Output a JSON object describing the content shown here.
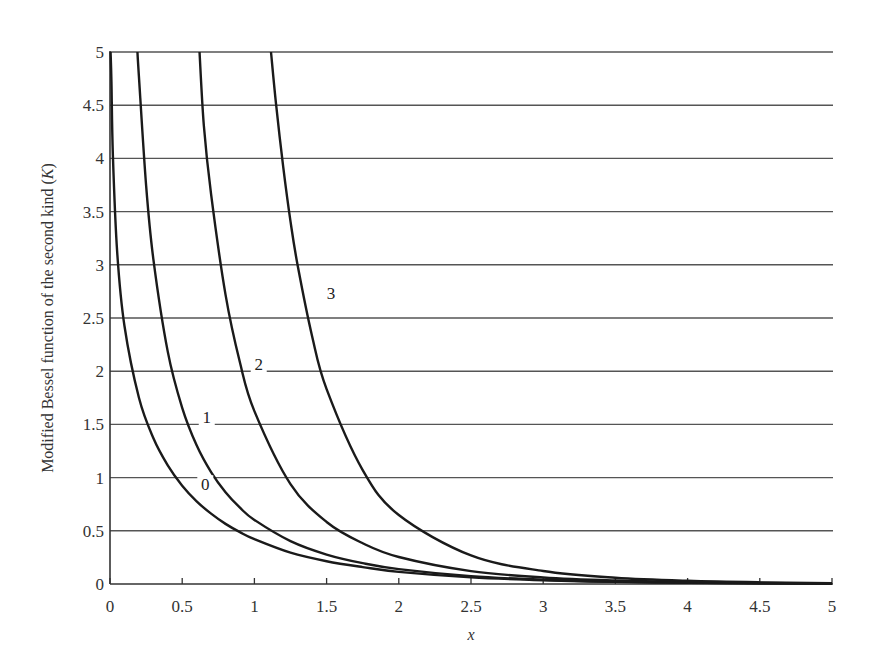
{
  "chart_data": {
    "type": "line",
    "title": "",
    "xlabel": "x",
    "ylabel": "Modified Bessel function of the second kind (K)",
    "xlim": [
      0,
      5
    ],
    "ylim": [
      0,
      5
    ],
    "x_ticks": [
      "0",
      "0.5",
      "1",
      "1.5",
      "2",
      "2.5",
      "3",
      "3.5",
      "4",
      "4.5",
      "5"
    ],
    "y_ticks": [
      "0",
      "0.5",
      "1",
      "1.5",
      "2",
      "2.5",
      "3",
      "3.5",
      "4",
      "4.5",
      "5"
    ],
    "grid": "horizontal",
    "legend": "inline curve labels",
    "series": [
      {
        "name": "0",
        "label_pos": [
          0.66,
          0.9
        ],
        "points": [
          [
            0.004,
            5.0
          ],
          [
            0.01,
            4.721
          ],
          [
            0.02,
            4.028
          ],
          [
            0.05,
            3.114
          ],
          [
            0.1,
            2.427
          ],
          [
            0.2,
            1.753
          ],
          [
            0.3,
            1.372
          ],
          [
            0.4,
            1.115
          ],
          [
            0.5,
            0.924
          ],
          [
            0.6,
            0.777
          ],
          [
            0.7,
            0.661
          ],
          [
            0.8,
            0.565
          ],
          [
            0.9,
            0.487
          ],
          [
            1.0,
            0.421
          ],
          [
            1.25,
            0.294
          ],
          [
            1.5,
            0.214
          ],
          [
            1.75,
            0.159
          ],
          [
            2.0,
            0.114
          ],
          [
            2.5,
            0.0623
          ],
          [
            3.0,
            0.0347
          ],
          [
            3.5,
            0.0196
          ],
          [
            4.0,
            0.0112
          ],
          [
            4.5,
            0.0064
          ],
          [
            5.0,
            0.0037
          ]
        ]
      },
      {
        "name": "1",
        "label_pos": [
          0.67,
          1.53
        ],
        "points": [
          [
            0.19,
            5.0
          ],
          [
            0.2,
            4.776
          ],
          [
            0.25,
            3.747
          ],
          [
            0.3,
            3.056
          ],
          [
            0.4,
            2.184
          ],
          [
            0.5,
            1.656
          ],
          [
            0.6,
            1.303
          ],
          [
            0.7,
            1.051
          ],
          [
            0.8,
            0.862
          ],
          [
            0.9,
            0.717
          ],
          [
            1.0,
            0.602
          ],
          [
            1.25,
            0.403
          ],
          [
            1.5,
            0.277
          ],
          [
            1.75,
            0.196
          ],
          [
            2.0,
            0.14
          ],
          [
            2.5,
            0.0739
          ],
          [
            3.0,
            0.0402
          ],
          [
            3.5,
            0.0222
          ],
          [
            4.0,
            0.0125
          ],
          [
            4.5,
            0.0071
          ],
          [
            5.0,
            0.004
          ]
        ]
      },
      {
        "name": "2",
        "label_pos": [
          1.03,
          2.03
        ],
        "points": [
          [
            0.62,
            5.0
          ],
          [
            0.65,
            4.307
          ],
          [
            0.7,
            3.664
          ],
          [
            0.8,
            2.72
          ],
          [
            0.9,
            2.081
          ],
          [
            1.0,
            1.625
          ],
          [
            1.25,
            0.939
          ],
          [
            1.5,
            0.583
          ],
          [
            1.75,
            0.383
          ],
          [
            2.0,
            0.254
          ],
          [
            2.5,
            0.1215
          ],
          [
            3.0,
            0.0615
          ],
          [
            3.5,
            0.0323
          ],
          [
            4.0,
            0.0174
          ],
          [
            4.5,
            0.0096
          ],
          [
            5.0,
            0.0053
          ]
        ]
      },
      {
        "name": "3",
        "label_pos": [
          1.53,
          2.7
        ],
        "points": [
          [
            1.115,
            5.0
          ],
          [
            1.15,
            4.51
          ],
          [
            1.2,
            3.915
          ],
          [
            1.25,
            3.408
          ],
          [
            1.3,
            2.991
          ],
          [
            1.4,
            2.327
          ],
          [
            1.5,
            1.832
          ],
          [
            1.75,
            1.071
          ],
          [
            2.0,
            0.648
          ],
          [
            2.5,
            0.268
          ],
          [
            3.0,
            0.122
          ],
          [
            3.5,
            0.0591
          ],
          [
            4.0,
            0.0299
          ],
          [
            4.5,
            0.0156
          ],
          [
            5.0,
            0.0082
          ]
        ]
      }
    ]
  },
  "colors": {
    "curve": "#1a1a1a",
    "grid": "#555555",
    "axis": "#333333",
    "text": "#333333"
  }
}
